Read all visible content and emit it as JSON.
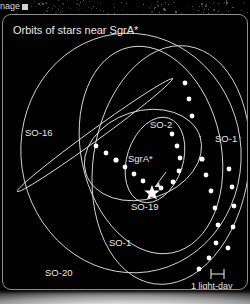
{
  "window": {
    "title_fragment": "nage",
    "handle_icon": "resize-handle-icon"
  },
  "panel": {
    "title": "Orbits of stars near SgrA*",
    "border_color": "#8e8e8e",
    "background_color": "#000000"
  },
  "diagram": {
    "center_marker": {
      "label": "SgrA*",
      "marker_icon": "star-marker-icon",
      "annotation_icon": "arrow-icon"
    },
    "orbit_color": "#dcdcdc",
    "dot_color": "#ffffff",
    "labels": [
      {
        "name": "SO-16",
        "text": "SO-16",
        "x": 22,
        "y": 118
      },
      {
        "name": "SO-2",
        "text": "SO-2",
        "x": 149,
        "y": 115
      },
      {
        "name": "SO-1-right",
        "text": "SO-1",
        "x": 216,
        "y": 129
      },
      {
        "name": "SgrA",
        "text": "SgrA*",
        "x": 152,
        "y": 147
      },
      {
        "name": "SO-19",
        "text": "SO-19",
        "x": 132,
        "y": 195
      },
      {
        "name": "SO-1-bottom",
        "text": "SO-1",
        "x": 110,
        "y": 232
      },
      {
        "name": "SO-20",
        "text": "SO-20",
        "x": 45,
        "y": 264
      }
    ]
  },
  "scalebar": {
    "caption": "1 light-day",
    "bar_icon": "scale-bar-icon",
    "caption_x": 191,
    "caption_y": 283,
    "bar_x": 210,
    "bar_y": 268
  }
}
